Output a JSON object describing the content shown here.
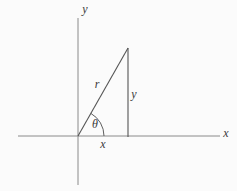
{
  "figure": {
    "colors": {
      "background": "#fbfbfb",
      "axis": "#8a8a8a",
      "triangle": "#555555",
      "arc": "#5e5e5e",
      "label": "#3a3a3a"
    },
    "labels": {
      "y_axis": "y",
      "x_axis": "x",
      "hypotenuse": "r",
      "opposite_side": "y",
      "adjacent_side": "x",
      "angle": "θ"
    }
  }
}
